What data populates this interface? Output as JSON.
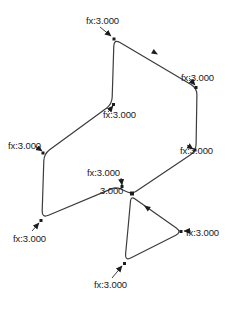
{
  "diagram": {
    "colors": {
      "background": "#ffffff",
      "line": "#3c3c3c",
      "marker": "#1c1c1c",
      "text": "#1a1a1a"
    },
    "labels": [
      {
        "id": "force-top",
        "text": "fx:3.000"
      },
      {
        "id": "force-right-upper",
        "text": "fx:3.000"
      },
      {
        "id": "force-left-middle",
        "text": "fx:3.000"
      },
      {
        "id": "force-left-upper",
        "text": "fx:3.000"
      },
      {
        "id": "force-right-lower",
        "text": "fx:3.000"
      },
      {
        "id": "force-center",
        "text": "fx:3.000"
      },
      {
        "id": "force-junction",
        "text": "3.000"
      },
      {
        "id": "force-left-lower",
        "text": "fx:3.000"
      },
      {
        "id": "force-triangle-right",
        "text": "fx:3.000"
      },
      {
        "id": "force-triangle-bottom",
        "text": "fx:3.000"
      }
    ]
  }
}
